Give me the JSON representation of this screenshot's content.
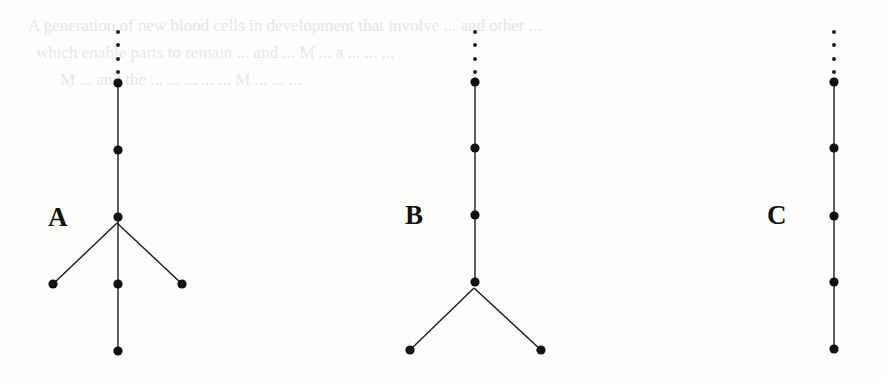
{
  "figure": {
    "background": "#fdfdfc",
    "ink_color": "#111111",
    "ghost_text_lines": [
      "A  generation  of  new  blood  cells  in  development  that  involve  ...  and  other  ...",
      "which  enable  parts  to  remain  ...  and  ...  M  ...  a  ...  ...  ...",
      "M  ...  and  the  ...  ...  ...  ...  ...  M  ...  ...  ..."
    ],
    "trees": [
      {
        "label": "A",
        "trunk_x": 118,
        "ellipsis_dots_y": [
          32,
          45,
          59,
          72
        ],
        "nodes_y": [
          83,
          150,
          217,
          284,
          351
        ],
        "branch_point": {
          "x": 117,
          "y": 223
        },
        "branch_leaves": [
          {
            "x": 53,
            "y": 284
          },
          {
            "x": 182,
            "y": 284
          }
        ],
        "label_pos": {
          "x": 48,
          "y": 226
        }
      },
      {
        "label": "B",
        "trunk_x": 475,
        "ellipsis_dots_y": [
          32,
          45,
          59,
          72
        ],
        "nodes_y": [
          82,
          148,
          215,
          282
        ],
        "branch_point": {
          "x": 474,
          "y": 288
        },
        "branch_leaves": [
          {
            "x": 410,
            "y": 350
          },
          {
            "x": 541,
            "y": 350
          }
        ],
        "label_pos": {
          "x": 405,
          "y": 224
        }
      },
      {
        "label": "C",
        "trunk_x": 834,
        "ellipsis_dots_y": [
          32,
          45,
          59,
          72
        ],
        "nodes_y": [
          82,
          148,
          216,
          282,
          349
        ],
        "branch_point": null,
        "branch_leaves": [],
        "label_pos": {
          "x": 767,
          "y": 224
        }
      }
    ]
  }
}
